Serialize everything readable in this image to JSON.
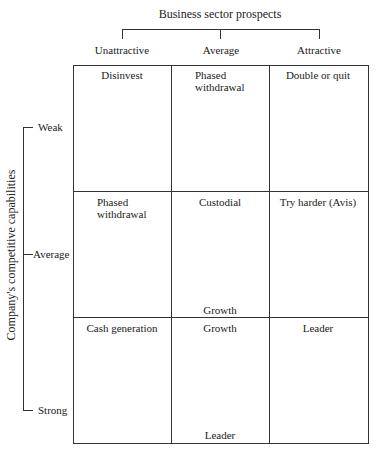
{
  "title": "Business sector prospects",
  "columns": [
    "Unattractive",
    "Average",
    "Attractive"
  ],
  "y_axis_title": "Company's competitive capabilities",
  "rows": [
    "Weak",
    "Average",
    "Strong"
  ],
  "cells": [
    [
      "Disinvest",
      "Phased\nwithdrawal",
      "Double or quit"
    ],
    [
      "Phased\nwithdrawal",
      "Custodial",
      "Try harder (Avis)"
    ],
    [
      "Cash generation",
      "Growth",
      "Leader"
    ]
  ],
  "extra_labels": {
    "middle_center_bottom": "Growth",
    "bottom_center_bottom": "Leader"
  }
}
